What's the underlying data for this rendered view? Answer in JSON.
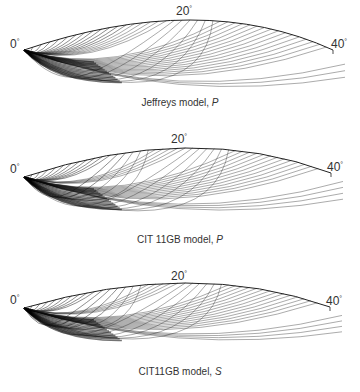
{
  "panels": [
    {
      "id": "jeffreys-p",
      "caption_text": "Jeffreys model, ",
      "caption_wave": "P",
      "labels": {
        "start": "0",
        "mid": "20",
        "end": "40",
        "degree": "°"
      },
      "geometry": {
        "top": 0,
        "origin": [
          24,
          50
        ],
        "end": [
          333,
          50
        ],
        "peak": [
          190,
          20
        ],
        "label_start": [
          10,
          38
        ],
        "label_mid": [
          176,
          5
        ],
        "label_end": [
          331,
          38
        ],
        "caption_y": 98
      },
      "rays": {
        "count": 42,
        "triplications": [
          [
            0.42,
            0.55
          ]
        ],
        "spread": 1.0,
        "tail_depth": 55
      }
    },
    {
      "id": "cit11gb-p",
      "caption_text": "CIT 11GB model, ",
      "caption_wave": "P",
      "labels": {
        "start": "0",
        "mid": "20",
        "end": "40",
        "degree": "°"
      },
      "geometry": {
        "top": 127,
        "origin": [
          24,
          50
        ],
        "end": [
          331,
          46
        ],
        "peak": [
          185,
          21
        ],
        "label_start": [
          10,
          36
        ],
        "label_mid": [
          171,
          6
        ],
        "label_end": [
          327,
          34
        ],
        "caption_y": 108
      },
      "rays": {
        "count": 44,
        "triplications": [
          [
            0.25,
            0.38
          ],
          [
            0.48,
            0.62
          ]
        ],
        "spread": 1.0,
        "tail_depth": 52
      }
    },
    {
      "id": "cit11gb-s",
      "caption_text": "CIT11GB model, ",
      "caption_wave": "S",
      "labels": {
        "start": "0",
        "mid": "20",
        "end": "40",
        "degree": "°"
      },
      "geometry": {
        "top": 258,
        "origin": [
          24,
          50
        ],
        "end": [
          330,
          49
        ],
        "peak": [
          185,
          25
        ],
        "label_start": [
          10,
          36
        ],
        "label_mid": [
          171,
          12
        ],
        "label_end": [
          326,
          37
        ],
        "caption_y": 109
      },
      "rays": {
        "count": 44,
        "triplications": [
          [
            0.22,
            0.36
          ],
          [
            0.46,
            0.6
          ]
        ],
        "spread": 1.0,
        "tail_depth": 48
      }
    }
  ]
}
